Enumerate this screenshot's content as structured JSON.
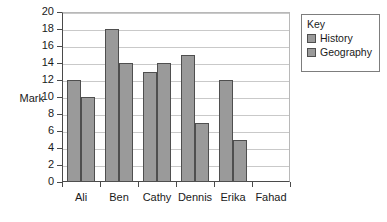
{
  "chart_data": {
    "type": "bar",
    "title": "",
    "xlabel": "",
    "ylabel": "Mark",
    "categories": [
      "Ali",
      "Ben",
      "Cathy",
      "Dennis",
      "Erika",
      "Fahad"
    ],
    "series": [
      {
        "name": "History",
        "values": [
          12,
          18,
          13,
          15,
          12,
          null
        ]
      },
      {
        "name": "Geography",
        "values": [
          10,
          14,
          14,
          7,
          5,
          null
        ]
      }
    ],
    "ylim": [
      0,
      20
    ],
    "yticks": [
      0,
      2,
      4,
      6,
      8,
      10,
      12,
      14,
      16,
      18,
      20
    ],
    "ytick_labels": [
      "0",
      "2",
      "4",
      "6",
      "8",
      "10",
      "12",
      "14",
      "16",
      "18",
      "20"
    ],
    "grid": true,
    "grid_axis": "y",
    "legend_position": "right-outside",
    "bar_color": "#9a9a9a",
    "bar_edge_color": "#4f4f4f",
    "grid_color": "#c9c9c9",
    "axis_color": "#4a4a4a"
  },
  "legend": {
    "title": "Key",
    "entries": [
      {
        "label": "History",
        "swatch": "#9a9a9a"
      },
      {
        "label": "Geography",
        "swatch": "#9a9a9a"
      }
    ]
  },
  "axes": {
    "y_title": "Mark"
  }
}
